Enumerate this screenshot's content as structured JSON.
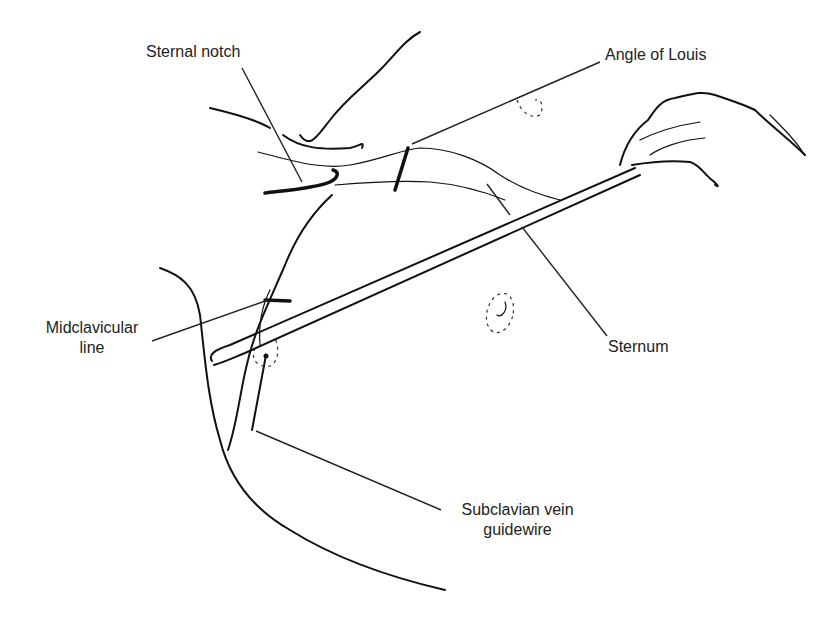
{
  "figure": {
    "type": "medical-illustration"
  },
  "labels": [
    {
      "id": "sternal-notch",
      "text": "Sternal notch",
      "x": 146,
      "y": 42
    },
    {
      "id": "angle-of-louis",
      "text": "Angle of Louis",
      "x": 605,
      "y": 45
    },
    {
      "id": "midclavicular-line",
      "lines": [
        "Midclavicular",
        "line"
      ],
      "x": 32,
      "y": 318
    },
    {
      "id": "sternum",
      "text": "Sternum",
      "x": 608,
      "y": 337
    },
    {
      "id": "subclavian-vein-guidewire",
      "lines": [
        "Subclavian vein",
        "guidewire"
      ],
      "x": 445,
      "y": 500
    }
  ]
}
